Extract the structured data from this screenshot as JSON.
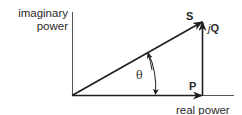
{
  "diagram": {
    "type": "power-triangle-phasor",
    "axes": {
      "y_label_line1": "imaginary",
      "y_label_line2": "power",
      "x_label": "real power"
    },
    "vectors": {
      "apparent": {
        "label": "S"
      },
      "reactive": {
        "prefix": "j",
        "label": "Q"
      },
      "real": {
        "label": "P"
      }
    },
    "angle": {
      "label": "θ"
    },
    "colors": {
      "line": "#1e1e1e",
      "axis": "#2a2a2a",
      "text": "#2a2a2a",
      "background": "#ffffff"
    }
  }
}
